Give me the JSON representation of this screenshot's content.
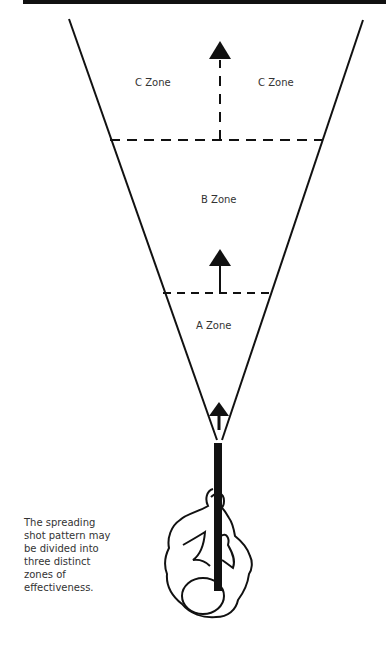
{
  "figure": {
    "zones": [
      {
        "id": "C",
        "labels": [
          "C Zone",
          "C Zone"
        ]
      },
      {
        "id": "B",
        "labels": [
          "B Zone"
        ]
      },
      {
        "id": "A",
        "labels": [
          "A Zone"
        ]
      }
    ],
    "caption_lines": [
      "The spreading",
      "shot pattern may",
      "be divided into",
      "three distinct",
      "zones of",
      "effectiveness."
    ],
    "colors": {
      "ink": "#111111",
      "text": "#333333",
      "background": "#ffffff"
    }
  }
}
